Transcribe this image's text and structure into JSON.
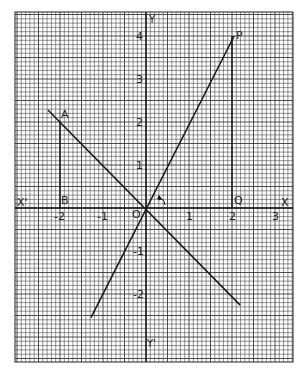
{
  "figure": {
    "type": "graph-paper coordinate diagram",
    "frame": {
      "left": 15,
      "top": 12,
      "right": 293,
      "bottom": 362
    },
    "origin_px": {
      "x": 146,
      "y": 208
    },
    "unit_px": 43,
    "minor_divisions": 10,
    "colors": {
      "grid": "#3a3a3a",
      "paper": "#ffffff",
      "ink": "#1a1a1a"
    }
  },
  "axes": {
    "x_positive_label": "X",
    "x_negative_label": "X'",
    "y_positive_label": "Y",
    "y_negative_label": "Y'",
    "origin_label": "O",
    "x_ticks": [
      {
        "value": -2,
        "label": "-2"
      },
      {
        "value": -1,
        "label": "-1"
      },
      {
        "value": 1,
        "label": "1"
      },
      {
        "value": 2,
        "label": "2"
      },
      {
        "value": 3,
        "label": "3"
      }
    ],
    "y_ticks": [
      {
        "value": 4,
        "label": "4"
      },
      {
        "value": 3,
        "label": "3"
      },
      {
        "value": 2,
        "label": "2"
      },
      {
        "value": 1,
        "label": "1"
      },
      {
        "value": -1,
        "label": "-1"
      },
      {
        "value": -2,
        "label": "-2"
      }
    ]
  },
  "lines": [
    {
      "name": "line-through-P",
      "from": [
        -1.28,
        -2.55
      ],
      "to": [
        2.05,
        4.0
      ],
      "description": "steep line y ≈ 2x through origin"
    },
    {
      "name": "line-through-A",
      "from": [
        -2.28,
        2.28
      ],
      "to": [
        2.19,
        -2.26
      ],
      "description": "line y = -x through origin"
    }
  ],
  "points": [
    {
      "label": "A",
      "x": -2.0,
      "y": 2.03
    },
    {
      "label": "B",
      "x": -2.0,
      "y": 0
    },
    {
      "label": "P",
      "x": 2.0,
      "y": 4.0
    },
    {
      "label": "Q",
      "x": 2.0,
      "y": 0
    }
  ],
  "perpendiculars": [
    {
      "name": "AB",
      "from": "A",
      "to": "B"
    },
    {
      "name": "PQ",
      "from": "P",
      "to": "Q"
    }
  ],
  "labels": {
    "A": "A",
    "B": "B",
    "P": "P",
    "Q": "Q",
    "O": "O"
  }
}
